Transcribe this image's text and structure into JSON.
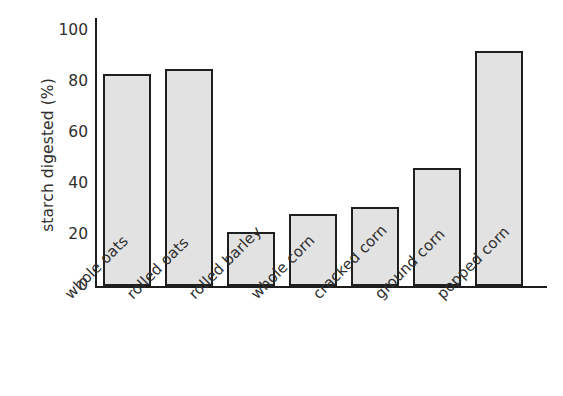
{
  "chart_data": {
    "type": "bar",
    "title": "",
    "xlabel": "",
    "ylabel": "starch digested (%)",
    "categories": [
      "whole oats",
      "rolled oats",
      "rolled barley",
      "whole corn",
      "cracked corn",
      "ground corn",
      "popped corn"
    ],
    "values": [
      83,
      85,
      21,
      28,
      31,
      46,
      92
    ],
    "ylim": [
      0,
      105
    ],
    "yticks": [
      0,
      20,
      40,
      60,
      80,
      100
    ],
    "ytick_labels": [
      "0",
      "20",
      "40",
      "60",
      "80",
      "100"
    ],
    "grid": false,
    "legend": null,
    "bar_fill_color": "#e2e2e2",
    "bar_edge_color": "#1f1f1f",
    "axis_color": "#1d1d1d",
    "background_color": "#ffffff",
    "xtick_label_rotation": -45
  }
}
